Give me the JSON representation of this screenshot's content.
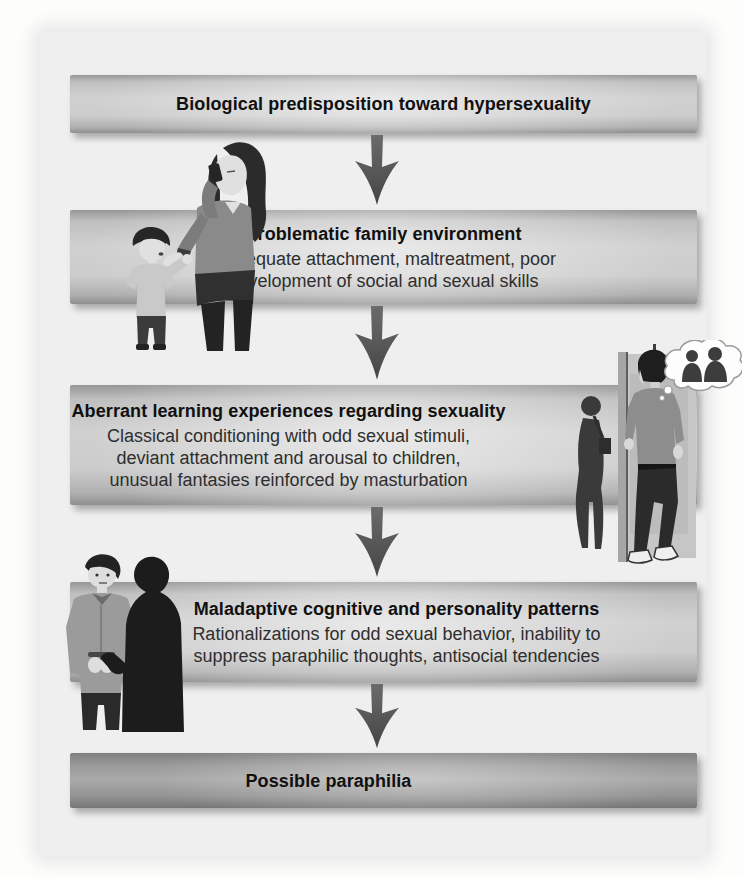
{
  "figure": {
    "type": "flowchart",
    "flow_direction": "top-down",
    "boxes": [
      {
        "title": "Biological predisposition toward hypersexuality",
        "subtitle": ""
      },
      {
        "title": "Problematic family environment",
        "subtitle": "Inadequate attachment, maltreatment, poor\ndevelopment of social and sexual skills"
      },
      {
        "title": "Aberrant learning experiences regarding sexuality",
        "subtitle": "Classical conditioning with odd sexual stimuli,\ndeviant attachment and arousal to children,\nunusual fantasies reinforced by masturbation"
      },
      {
        "title": "Maladaptive cognitive and personality patterns",
        "subtitle": "Rationalizations for odd sexual behavior, inability to\nsuppress paraphilic thoughts, antisocial tendencies"
      },
      {
        "title": "Possible paraphilia",
        "subtitle": ""
      }
    ],
    "connectors": {
      "style": "tapered-down-arrow",
      "count": 4,
      "color": "#565656"
    },
    "illustrations": [
      {
        "name": "mother-on-phone-with-child-illustration",
        "depicts": "Woman talking on a cell phone gesturing stop to a boy reaching toward her"
      },
      {
        "name": "voyeur-illustration",
        "depicts": "Man peeking around a wall edge at a woman's dark silhouette, with a thought bubble of silhouetted figures"
      },
      {
        "name": "arrest-illustration",
        "depicts": "Man with cuffed hands standing next to a dark silhouetted figure"
      }
    ],
    "colors": {
      "page_background": "#fdfdfc",
      "panel_background": "#efefef",
      "box_light": "#d0d0d0",
      "box_edge": "#8f8f8f",
      "final_box": "#a9a9a9",
      "arrow": "#565656",
      "title_text": "#101010",
      "subtitle_text": "#2e2e2e"
    }
  }
}
